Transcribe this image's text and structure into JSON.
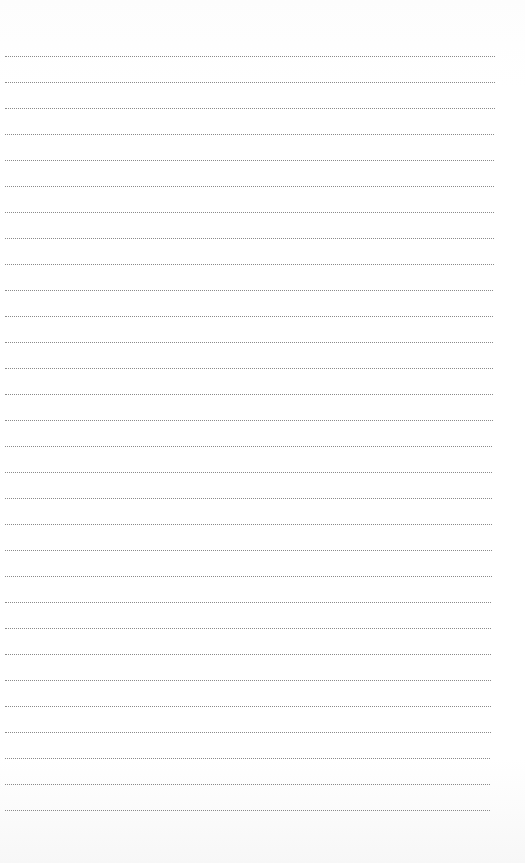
{
  "page": {
    "type": "lined-paper",
    "background_color": "#fefefe",
    "line_color": "#8a8a8a",
    "line_style": "dotted",
    "line_count": 30,
    "first_line_y": 56,
    "line_spacing": 26,
    "left_margin": 5,
    "line_right_start": 495,
    "line_right_end": 490,
    "text": []
  }
}
